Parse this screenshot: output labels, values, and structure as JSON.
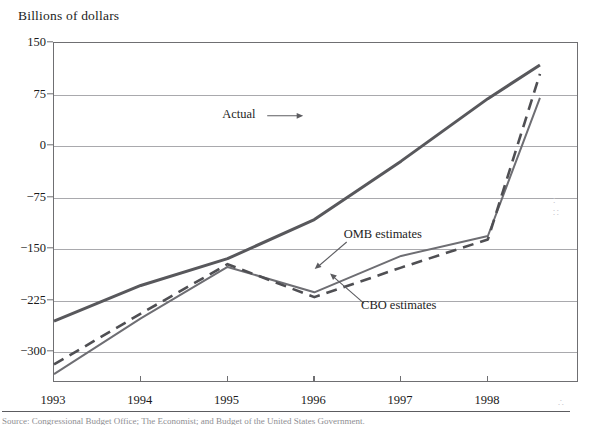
{
  "figure": {
    "y_axis_title": "Billions of dollars",
    "source_note": "Source: Congressional Budget Office; The Economist; and Budget of the United States Government."
  },
  "chart_data": {
    "type": "line",
    "title": "",
    "subtitle": "",
    "xlabel": "",
    "ylabel": "Billions of dollars",
    "x": [
      1993,
      1994,
      1995,
      1996,
      1997,
      1998,
      1998.6
    ],
    "xlim": [
      1993,
      1999.05
    ],
    "ylim": [
      -345,
      150
    ],
    "xticks": [
      1993,
      1994,
      1995,
      1996,
      1997,
      1998
    ],
    "xtick_labels": [
      "1993",
      "1994",
      "1995",
      "1996",
      "1997",
      "1998"
    ],
    "yticks": [
      150,
      75,
      0,
      -75,
      -150,
      -225,
      -300
    ],
    "ytick_labels": [
      "150",
      "75",
      "0",
      "−75",
      "−150",
      "−225",
      "−300"
    ],
    "grid": true,
    "legend": "none",
    "series": [
      {
        "name": "Actual",
        "style": "solid",
        "width": 3.0,
        "color": "#58585c",
        "x": [
          1993,
          1994,
          1995,
          1996,
          1997,
          1998,
          1998.6
        ],
        "values": [
          -255,
          -203,
          -164,
          -107,
          -22,
          69,
          118
        ]
      },
      {
        "name": "OMB estimates",
        "style": "solid",
        "width": 2.0,
        "color": "#6e6e73",
        "x": [
          1993,
          1994,
          1995,
          1996,
          1997,
          1998,
          1998.6
        ],
        "values": [
          -332,
          -251,
          -176,
          -213,
          -160,
          -131,
          70
        ]
      },
      {
        "name": "CBO estimates",
        "style": "dashed",
        "width": 2.6,
        "color": "#4f4f53",
        "x": [
          1993,
          1994,
          1995,
          1996,
          1997,
          1998,
          1998.6
        ],
        "values": [
          -318,
          -244,
          -172,
          -220,
          -177,
          -136,
          105
        ]
      }
    ],
    "annotations": [
      {
        "text": "Actual",
        "x": 1994.95,
        "y": 44,
        "arrow": "right"
      },
      {
        "text": "OMB estimates",
        "x": 1996.35,
        "y": -131,
        "arrow": "down-left"
      },
      {
        "text": "CBO estimates",
        "x": 1996.55,
        "y": -235,
        "arrow": "up-left"
      }
    ]
  },
  "speckles": [
    "∴",
    "∵",
    "∷"
  ]
}
